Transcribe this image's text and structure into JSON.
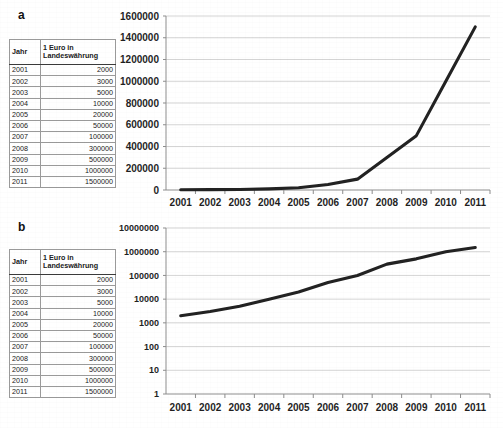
{
  "figure": {
    "panels": [
      {
        "letter": "a",
        "table": {
          "headers": [
            "Jahr",
            "1 Euro in Landeswährung"
          ],
          "header_year": "Jahr",
          "header_rate_line1": "1 Euro in",
          "header_rate_line2": "Landeswährung",
          "rows": [
            {
              "year": "2001",
              "value": "2000"
            },
            {
              "year": "2002",
              "value": "3000"
            },
            {
              "year": "2003",
              "value": "5000"
            },
            {
              "year": "2004",
              "value": "10000"
            },
            {
              "year": "2005",
              "value": "20000"
            },
            {
              "year": "2006",
              "value": "50000"
            },
            {
              "year": "2007",
              "value": "100000"
            },
            {
              "year": "2008",
              "value": "300000"
            },
            {
              "year": "2009",
              "value": "500000"
            },
            {
              "year": "2010",
              "value": "1000000"
            },
            {
              "year": "2011",
              "value": "1500000"
            }
          ]
        }
      },
      {
        "letter": "b",
        "table": {
          "headers": [
            "Jahr",
            "1 Euro in Landeswährung"
          ],
          "header_year": "Jahr",
          "header_rate_line1": "1 Euro in",
          "header_rate_line2": "Landeswährung",
          "rows": [
            {
              "year": "2001",
              "value": "2000"
            },
            {
              "year": "2002",
              "value": "3000"
            },
            {
              "year": "2003",
              "value": "5000"
            },
            {
              "year": "2004",
              "value": "10000"
            },
            {
              "year": "2005",
              "value": "20000"
            },
            {
              "year": "2006",
              "value": "50000"
            },
            {
              "year": "2007",
              "value": "100000"
            },
            {
              "year": "2008",
              "value": "300000"
            },
            {
              "year": "2009",
              "value": "500000"
            },
            {
              "year": "2010",
              "value": "1000000"
            },
            {
              "year": "2011",
              "value": "1500000"
            }
          ]
        }
      }
    ]
  },
  "chart_data": [
    {
      "type": "line",
      "panel": "a",
      "title": "",
      "xlabel": "",
      "ylabel": "",
      "scale": "linear",
      "x": [
        "2001",
        "2002",
        "2003",
        "2004",
        "2005",
        "2006",
        "2007",
        "2008",
        "2009",
        "2010",
        "2011"
      ],
      "categories": [
        "2001",
        "2002",
        "2003",
        "2004",
        "2005",
        "2006",
        "2007",
        "2008",
        "2009",
        "2010",
        "2011"
      ],
      "values": [
        2000,
        3000,
        5000,
        10000,
        20000,
        50000,
        100000,
        300000,
        500000,
        1000000,
        1500000
      ],
      "series": [
        {
          "name": "1 Euro in Landeswährung",
          "values": [
            2000,
            3000,
            5000,
            10000,
            20000,
            50000,
            100000,
            300000,
            500000,
            1000000,
            1500000
          ]
        }
      ],
      "ylim": [
        0,
        1600000
      ],
      "yticks": [
        0,
        200000,
        400000,
        600000,
        800000,
        1000000,
        1200000,
        1400000,
        1600000
      ],
      "ytick_labels": [
        "0",
        "200000",
        "400000",
        "600000",
        "800000",
        "1000000",
        "1200000",
        "1400000",
        "1600000"
      ],
      "xtick_labels": [
        "2001",
        "2002",
        "2003",
        "2004",
        "2005",
        "2006",
        "2007",
        "2008",
        "2009",
        "2010",
        "2011"
      ],
      "grid": true,
      "legend": false,
      "line_color": "#222222"
    },
    {
      "type": "line",
      "panel": "b",
      "title": "",
      "xlabel": "",
      "ylabel": "",
      "scale": "log",
      "x": [
        "2001",
        "2002",
        "2003",
        "2004",
        "2005",
        "2006",
        "2007",
        "2008",
        "2009",
        "2010",
        "2011"
      ],
      "categories": [
        "2001",
        "2002",
        "2003",
        "2004",
        "2005",
        "2006",
        "2007",
        "2008",
        "2009",
        "2010",
        "2011"
      ],
      "values": [
        2000,
        3000,
        5000,
        10000,
        20000,
        50000,
        100000,
        300000,
        500000,
        1000000,
        1500000
      ],
      "series": [
        {
          "name": "1 Euro in Landeswährung",
          "values": [
            2000,
            3000,
            5000,
            10000,
            20000,
            50000,
            100000,
            300000,
            500000,
            1000000,
            1500000
          ]
        }
      ],
      "ylim": [
        1,
        10000000
      ],
      "yticks": [
        1,
        10,
        100,
        1000,
        10000,
        100000,
        1000000,
        10000000
      ],
      "ytick_labels": [
        "1",
        "10",
        "100",
        "1000",
        "10000",
        "100000",
        "1000000",
        "10000000"
      ],
      "xtick_labels": [
        "2001",
        "2002",
        "2003",
        "2004",
        "2005",
        "2006",
        "2007",
        "2008",
        "2009",
        "2010",
        "2011"
      ],
      "grid": true,
      "legend": false,
      "line_color": "#222222"
    }
  ]
}
